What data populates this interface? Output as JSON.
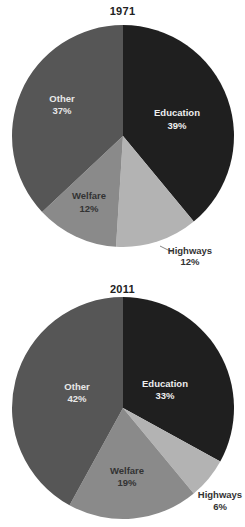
{
  "chart_data": [
    {
      "type": "pie",
      "title": "1971",
      "start_angle_deg": 0,
      "direction": "clockwise",
      "categories": [
        "Education",
        "Highways",
        "Welfare",
        "Other"
      ],
      "values": [
        39,
        12,
        12,
        37
      ],
      "labels": [
        "39%",
        "12%",
        "12%",
        "37%"
      ],
      "colors": [
        "#1f1f1f",
        "#b3b3b3",
        "#8a8a8a",
        "#565656"
      ]
    },
    {
      "type": "pie",
      "title": "2011",
      "start_angle_deg": 0,
      "direction": "clockwise",
      "categories": [
        "Education",
        "Highways",
        "Welfare",
        "Other"
      ],
      "values": [
        33,
        6,
        19,
        42
      ],
      "labels": [
        "33%",
        "6%",
        "19%",
        "42%"
      ],
      "colors": [
        "#1f1f1f",
        "#b3b3b3",
        "#8a8a8a",
        "#565656"
      ]
    }
  ],
  "charts": {
    "c1971": {
      "title": "1971",
      "education": {
        "name": "Education",
        "pct": "39%"
      },
      "highways": {
        "name": "Highways",
        "pct": "12%"
      },
      "welfare": {
        "name": "Welfare",
        "pct": "12%"
      },
      "other": {
        "name": "Other",
        "pct": "37%"
      }
    },
    "c2011": {
      "title": "2011",
      "education": {
        "name": "Education",
        "pct": "33%"
      },
      "highways": {
        "name": "Highways",
        "pct": "6%"
      },
      "welfare": {
        "name": "Welfare",
        "pct": "19%"
      },
      "other": {
        "name": "Other",
        "pct": "42%"
      }
    }
  }
}
